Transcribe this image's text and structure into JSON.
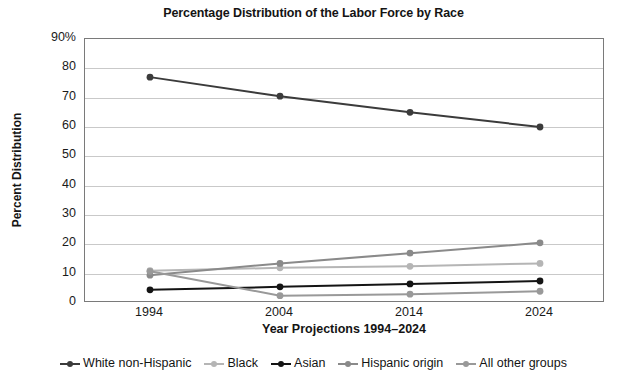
{
  "chart_data": {
    "type": "line",
    "title": "Percentage Distribution of the Labor Force by Race",
    "xlabel": "Year Projections 1994–2024",
    "ylabel": "Percent Distribution",
    "categories": [
      "1994",
      "2004",
      "2014",
      "2024"
    ],
    "x": [
      1994,
      2004,
      2014,
      2024
    ],
    "ylim": [
      0,
      90
    ],
    "ytick_labels": [
      "90%",
      "80",
      "70",
      "60",
      "50",
      "40",
      "30",
      "20",
      "10",
      "0"
    ],
    "ytick_values": [
      90,
      80,
      70,
      60,
      50,
      40,
      30,
      20,
      10,
      0
    ],
    "grid": true,
    "legend_position": "bottom",
    "series": [
      {
        "name": "White non-Hispanic",
        "color": "#3b3b3b",
        "values": [
          77,
          70.5,
          65,
          60
        ]
      },
      {
        "name": "Black",
        "color": "#b5b5b5",
        "values": [
          11,
          12,
          12.5,
          13.5
        ]
      },
      {
        "name": "Asian",
        "color": "#141414",
        "values": [
          4.5,
          5.5,
          6.5,
          7.5
        ]
      },
      {
        "name": "Hispanic origin",
        "color": "#8a8a8a",
        "values": [
          9.5,
          13.5,
          17,
          20.5
        ]
      },
      {
        "name": "All other groups",
        "color": "#999999",
        "values": [
          10.8,
          2.5,
          3,
          4
        ]
      }
    ]
  }
}
